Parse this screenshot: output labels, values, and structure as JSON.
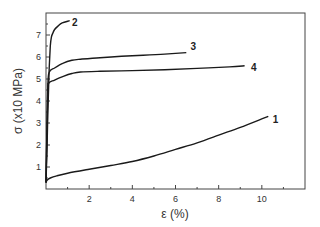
{
  "chart_data": {
    "type": "line",
    "title": "",
    "xlabel": "ε (%)",
    "ylabel": "σ (x10 MPa)",
    "xlim": [
      0,
      12
    ],
    "ylim": [
      0,
      8
    ],
    "xticks": [
      2,
      4,
      6,
      8,
      10
    ],
    "yticks": [
      1,
      2,
      3,
      4,
      5,
      6,
      7
    ],
    "grid": false,
    "legend": "inline curve labels",
    "series": [
      {
        "name": "1",
        "x": [
          0,
          0.05,
          0.2,
          0.5,
          1,
          2,
          3,
          4,
          5,
          6,
          7,
          8,
          9,
          10.3
        ],
        "y": [
          0.3,
          0.4,
          0.5,
          0.6,
          0.72,
          0.9,
          1.07,
          1.25,
          1.5,
          1.8,
          2.1,
          2.45,
          2.8,
          3.3
        ]
      },
      {
        "name": "2",
        "x": [
          0,
          0.05,
          0.1,
          0.15,
          0.2,
          0.25,
          0.3,
          0.4,
          0.55,
          0.75,
          1.1
        ],
        "y": [
          0.3,
          2.0,
          4.0,
          5.5,
          6.5,
          6.9,
          7.05,
          7.25,
          7.4,
          7.55,
          7.65
        ]
      },
      {
        "name": "3",
        "x": [
          0,
          0.08,
          0.15,
          0.4,
          0.8,
          1.2,
          1.6,
          2.5,
          3.5,
          4.5,
          5.5,
          6.5
        ],
        "y": [
          0.3,
          4.5,
          5.3,
          5.5,
          5.72,
          5.85,
          5.9,
          5.97,
          6.03,
          6.08,
          6.13,
          6.2
        ]
      },
      {
        "name": "4",
        "x": [
          0,
          0.08,
          0.12,
          0.4,
          0.8,
          1.2,
          1.6,
          2.5,
          4,
          5.5,
          7,
          8.5,
          9.2
        ],
        "y": [
          0.3,
          4.3,
          4.8,
          4.95,
          5.12,
          5.25,
          5.32,
          5.35,
          5.38,
          5.42,
          5.48,
          5.55,
          5.6
        ]
      }
    ],
    "annotations": [
      {
        "text": "1",
        "x": 10.5,
        "y": 3.2
      },
      {
        "text": "2",
        "x": 1.2,
        "y": 7.6
      },
      {
        "text": "3",
        "x": 6.7,
        "y": 6.5
      },
      {
        "text": "4",
        "x": 9.5,
        "y": 5.55
      }
    ]
  }
}
